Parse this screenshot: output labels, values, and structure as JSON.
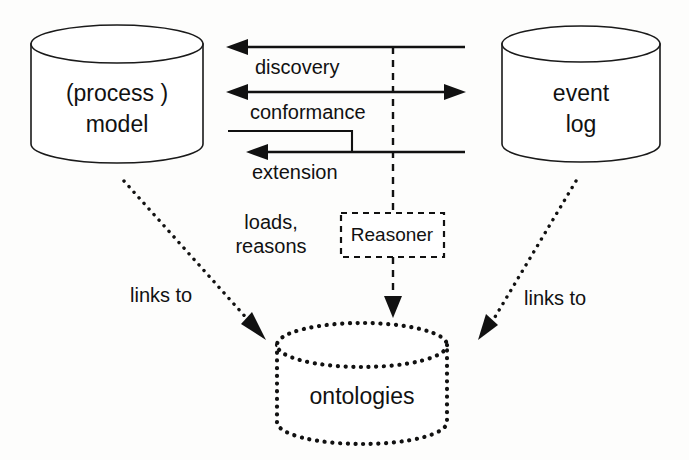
{
  "figure": {
    "background_color": "#fdfdfc",
    "ink_color": "#111111"
  },
  "nodes": [
    {
      "id": "process-model",
      "shape": "cylinder",
      "style": "solid",
      "label_line1": "(process )",
      "label_line2": "model"
    },
    {
      "id": "event-log",
      "shape": "cylinder",
      "style": "solid",
      "label_line1": "event",
      "label_line2": "log"
    },
    {
      "id": "ontologies",
      "shape": "cylinder",
      "style": "dotted",
      "label_line1": "ontologies",
      "label_line2": ""
    },
    {
      "id": "reasoner",
      "shape": "rectangle",
      "style": "dashed",
      "label_line1": "Reasoner",
      "label_line2": ""
    }
  ],
  "edges": [
    {
      "id": "discovery",
      "label": "discovery",
      "from": "event-log",
      "to": "process-model",
      "direction": "left",
      "style": "solid"
    },
    {
      "id": "conformance",
      "label": "conformance",
      "from": "process-model",
      "to": "event-log",
      "direction": "both",
      "style": "solid"
    },
    {
      "id": "extension",
      "label": "extension",
      "from": "event-log",
      "to": "process-model",
      "direction": "left",
      "style": "solid"
    },
    {
      "id": "loads-reasons",
      "label_line1": "loads,",
      "label_line2": "reasons",
      "from": "reasoner",
      "to": "ontologies",
      "direction": "down",
      "style": "dashed"
    },
    {
      "id": "links-to-left",
      "label": "links to",
      "from": "process-model",
      "to": "ontologies",
      "direction": "down-right",
      "style": "dotted"
    },
    {
      "id": "links-to-right",
      "label": "links to",
      "from": "event-log",
      "to": "ontologies",
      "direction": "down-left",
      "style": "dotted"
    }
  ]
}
